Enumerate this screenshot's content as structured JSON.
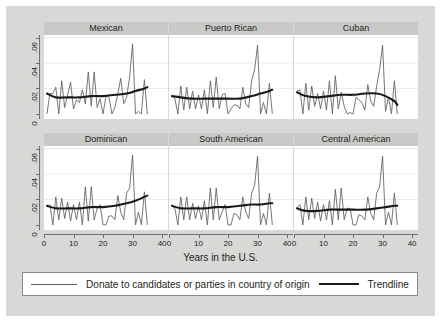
{
  "figure": {
    "background_color": "#d8d8d6",
    "panel_title_bg": "#c9c9c7",
    "axis_color": "#6f6f6f",
    "series_color": "#5f5f5f",
    "trend_color": "#1a1a1a",
    "xlabel": "Years in the U.S.",
    "legend": {
      "series_label": "Donate to candidates or parties in country of origin",
      "trend_label": "Trendline"
    }
  },
  "chart_data": {
    "type": "line",
    "title": "",
    "xlabel": "Years in the U.S.",
    "ylabel": "",
    "xlim": [
      0,
      42
    ],
    "ylim": [
      -0.004,
      0.062
    ],
    "xticks": [
      0,
      10,
      20,
      30,
      40
    ],
    "xticklabels": [
      "0",
      "10",
      "20",
      "30",
      "40"
    ],
    "yticks": [
      0,
      0.02,
      0.04,
      0.06
    ],
    "yticklabels": [
      "0",
      ".02",
      ".04",
      ".06"
    ],
    "grid": "horizontal",
    "legend_position": "bottom",
    "layout": {
      "rows": 2,
      "cols": 3
    },
    "panels": [
      {
        "title": "Mexican",
        "series": [
          {
            "name": "Donate to candidates or parties in country of origin",
            "x": [
              1,
              2,
              3,
              4,
              5,
              6,
              7,
              8,
              9,
              10,
              11,
              12,
              13,
              14,
              15,
              16,
              17,
              18,
              19,
              20,
              21,
              22,
              23,
              24,
              25,
              26,
              27,
              28,
              29,
              30,
              31,
              32,
              33,
              34,
              35
            ],
            "values": [
              0.0,
              0.016,
              0.016,
              0.021,
              0.0,
              0.026,
              0.005,
              0.015,
              0.025,
              0.004,
              0.011,
              0.009,
              0.019,
              0.008,
              0.033,
              0.006,
              0.033,
              0.005,
              0.012,
              0.0,
              0.014,
              0.013,
              0.0,
              0.005,
              0.016,
              0.028,
              0.008,
              0.013,
              0.029,
              0.055,
              0.0,
              0.002,
              0.0,
              0.027,
              0.0
            ]
          },
          {
            "name": "Trendline",
            "x": [
              1,
              4,
              8,
              12,
              16,
              20,
              24,
              28,
              31,
              34,
              35
            ],
            "values": [
              0.016,
              0.013,
              0.013,
              0.013,
              0.014,
              0.014,
              0.015,
              0.016,
              0.018,
              0.02,
              0.021
            ]
          }
        ]
      },
      {
        "title": "Puerto Rican",
        "series": [
          {
            "name": "Donate to candidates or parties in country of origin",
            "x": [
              1,
              2,
              3,
              4,
              5,
              6,
              7,
              8,
              9,
              10,
              11,
              12,
              13,
              14,
              15,
              16,
              17,
              18,
              19,
              20,
              21,
              22,
              23,
              24,
              25,
              26,
              27,
              28,
              29,
              30,
              31,
              32,
              33,
              34,
              35
            ],
            "values": [
              0.014,
              0.012,
              0.0,
              0.022,
              0.003,
              0.021,
              0.004,
              0.018,
              0.004,
              0.015,
              0.004,
              0.019,
              0.0,
              0.026,
              0.005,
              0.029,
              0.004,
              0.015,
              0.016,
              0.0,
              0.004,
              0.007,
              0.007,
              0.004,
              0.021,
              0.008,
              0.005,
              0.026,
              0.035,
              0.054,
              0.0,
              0.009,
              0.0,
              0.024,
              0.0
            ]
          },
          {
            "name": "Trendline",
            "x": [
              1,
              4,
              8,
              12,
              16,
              20,
              24,
              28,
              31,
              34,
              35
            ],
            "values": [
              0.014,
              0.013,
              0.012,
              0.012,
              0.012,
              0.012,
              0.012,
              0.014,
              0.016,
              0.018,
              0.019
            ]
          }
        ]
      },
      {
        "title": "Cuban",
        "series": [
          {
            "name": "Donate to candidates or parties in country of origin",
            "x": [
              1,
              2,
              3,
              4,
              5,
              6,
              7,
              8,
              9,
              10,
              11,
              12,
              13,
              14,
              15,
              16,
              17,
              18,
              19,
              20,
              21,
              22,
              23,
              24,
              25,
              26,
              27,
              28,
              29,
              30,
              31,
              32,
              33,
              34,
              35
            ],
            "values": [
              0.018,
              0.019,
              0.0,
              0.024,
              0.003,
              0.022,
              0.006,
              0.016,
              0.004,
              0.018,
              0.003,
              0.026,
              0.0,
              0.03,
              0.004,
              0.017,
              0.006,
              0.0,
              0.001,
              0.0,
              0.013,
              0.011,
              0.009,
              0.003,
              0.023,
              0.01,
              0.006,
              0.022,
              0.035,
              0.054,
              0.002,
              0.013,
              0.0,
              0.026,
              0.0
            ]
          },
          {
            "name": "Trendline",
            "x": [
              1,
              4,
              8,
              12,
              16,
              20,
              24,
              28,
              31,
              34,
              35
            ],
            "values": [
              0.017,
              0.014,
              0.013,
              0.014,
              0.015,
              0.015,
              0.016,
              0.016,
              0.014,
              0.01,
              0.007
            ]
          }
        ]
      },
      {
        "title": "Dominican",
        "series": [
          {
            "name": "Donate to candidates or parties in country of origin",
            "x": [
              1,
              2,
              3,
              4,
              5,
              6,
              7,
              8,
              9,
              10,
              11,
              12,
              13,
              14,
              15,
              16,
              17,
              18,
              19,
              20,
              21,
              22,
              23,
              24,
              25,
              26,
              27,
              28,
              29,
              30,
              31,
              32,
              33,
              34,
              35
            ],
            "values": [
              0.014,
              0.016,
              0.0,
              0.022,
              0.004,
              0.021,
              0.005,
              0.018,
              0.003,
              0.016,
              0.004,
              0.018,
              0.0,
              0.03,
              0.003,
              0.03,
              0.004,
              0.013,
              0.016,
              0.0,
              0.0,
              0.007,
              0.007,
              0.004,
              0.023,
              0.01,
              0.004,
              0.025,
              0.029,
              0.055,
              0.0,
              0.01,
              0.0,
              0.026,
              0.0
            ]
          },
          {
            "name": "Trendline",
            "x": [
              1,
              4,
              8,
              12,
              16,
              20,
              24,
              28,
              31,
              34,
              35
            ],
            "values": [
              0.015,
              0.013,
              0.013,
              0.013,
              0.014,
              0.014,
              0.015,
              0.017,
              0.019,
              0.022,
              0.023
            ]
          }
        ]
      },
      {
        "title": "South American",
        "series": [
          {
            "name": "Donate to candidates or parties in country of origin",
            "x": [
              1,
              2,
              3,
              4,
              5,
              6,
              7,
              8,
              9,
              10,
              11,
              12,
              13,
              14,
              15,
              16,
              17,
              18,
              19,
              20,
              21,
              22,
              23,
              24,
              25,
              26,
              27,
              28,
              29,
              30,
              31,
              32,
              33,
              34,
              35
            ],
            "values": [
              0.015,
              0.013,
              0.0,
              0.022,
              0.004,
              0.022,
              0.004,
              0.017,
              0.005,
              0.015,
              0.004,
              0.019,
              0.0,
              0.029,
              0.004,
              0.029,
              0.004,
              0.01,
              0.016,
              0.0,
              0.0,
              0.009,
              0.008,
              0.004,
              0.022,
              0.01,
              0.005,
              0.025,
              0.031,
              0.054,
              0.0,
              0.009,
              0.0,
              0.025,
              0.0
            ]
          },
          {
            "name": "Trendline",
            "x": [
              1,
              4,
              8,
              12,
              16,
              20,
              24,
              28,
              31,
              34,
              35
            ],
            "values": [
              0.015,
              0.013,
              0.013,
              0.013,
              0.014,
              0.014,
              0.015,
              0.016,
              0.016,
              0.017,
              0.017
            ]
          }
        ]
      },
      {
        "title": "Central American",
        "series": [
          {
            "name": "Donate to candidates or parties in country of origin",
            "x": [
              1,
              2,
              3,
              4,
              5,
              6,
              7,
              8,
              9,
              10,
              11,
              12,
              13,
              14,
              15,
              16,
              17,
              18,
              19,
              20,
              21,
              22,
              23,
              24,
              25,
              26,
              27,
              28,
              29,
              30,
              31,
              32,
              33,
              34,
              35
            ],
            "values": [
              0.013,
              0.016,
              0.0,
              0.022,
              0.004,
              0.021,
              0.005,
              0.018,
              0.003,
              0.016,
              0.004,
              0.019,
              0.0,
              0.028,
              0.004,
              0.029,
              0.004,
              0.013,
              0.013,
              0.0,
              0.0,
              0.008,
              0.007,
              0.004,
              0.022,
              0.009,
              0.004,
              0.025,
              0.03,
              0.054,
              0.0,
              0.01,
              0.0,
              0.025,
              0.0
            ]
          },
          {
            "name": "Trendline",
            "x": [
              1,
              4,
              8,
              12,
              16,
              20,
              24,
              28,
              31,
              34,
              35
            ],
            "values": [
              0.013,
              0.011,
              0.011,
              0.012,
              0.012,
              0.012,
              0.012,
              0.013,
              0.014,
              0.015,
              0.015
            ]
          }
        ]
      }
    ]
  }
}
